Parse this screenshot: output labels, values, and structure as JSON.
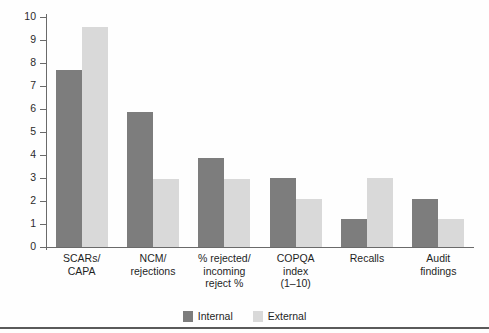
{
  "chart_data": {
    "type": "bar",
    "title": "",
    "subtitle": "",
    "xlabel": "",
    "ylabel": "",
    "ylim": [
      0,
      10
    ],
    "yticks": [
      0,
      1,
      2,
      3,
      4,
      5,
      6,
      7,
      8,
      9,
      10
    ],
    "ytick_labels": [
      "0",
      "1",
      "2",
      "3",
      "4",
      "5",
      "6",
      "7",
      "8",
      "9",
      "10"
    ],
    "grid": false,
    "legend_position": "bottom-center",
    "categories": [
      "SCARs/\nCAPA",
      "NCM/\nrejections",
      "% rejected/\nincoming\nreject %",
      "COPQA\nindex\n(1–10)",
      "Recalls",
      "Audit\nfindings"
    ],
    "series": [
      {
        "name": "Internal",
        "color": "#7d7d7d",
        "values": [
          7.7,
          5.85,
          3.85,
          3.0,
          1.2,
          2.1
        ]
      },
      {
        "name": "External",
        "color": "#d9d9d9",
        "values": [
          9.55,
          2.95,
          2.95,
          2.1,
          3.0,
          1.2
        ]
      }
    ]
  },
  "legend": {
    "items": [
      {
        "label": "Internal",
        "series": "internal"
      },
      {
        "label": "External",
        "series": "external"
      }
    ]
  },
  "colors": {
    "internal": "#7d7d7d",
    "external": "#d9d9d9",
    "axis": "#6a6a6a",
    "rule": "#5a5a5a",
    "text": "#1f1f1f",
    "background": "#fefefe"
  }
}
